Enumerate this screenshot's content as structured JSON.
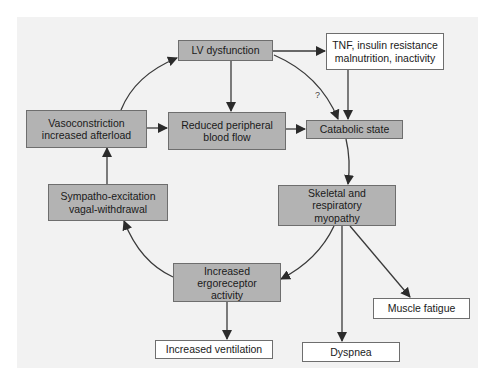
{
  "diagram": {
    "colors": {
      "panel_background": "#f2f2f2",
      "process_box_fill": "#b3b3b3",
      "outcome_box_fill": "#ffffff",
      "arrow": "#333333"
    },
    "nodes": {
      "lv_dysfunction": {
        "label": "LV dysfunction",
        "style": "gray"
      },
      "tnf": {
        "line1": "TNF, insulin resistance",
        "line2": "malnutrition, inactivity",
        "style": "white"
      },
      "vasoconstriction": {
        "line1": "Vasoconstriction",
        "line2": "increased afterload",
        "style": "gray"
      },
      "reduced_flow": {
        "line1": "Reduced peripheral",
        "line2": "blood flow",
        "style": "gray"
      },
      "catabolic": {
        "label": "Catabolic state",
        "style": "gray"
      },
      "sympatho": {
        "line1": "Sympatho-excitation",
        "line2": "vagal-withdrawal",
        "style": "gray"
      },
      "myopathy": {
        "line1": "Skeletal and respiratory",
        "line2": "myopathy",
        "style": "gray"
      },
      "ergoreceptor": {
        "line1": "Increased",
        "line2": "ergoreceptor",
        "line3": "activity",
        "style": "gray"
      },
      "muscle_fatigue": {
        "label": "Muscle fatigue",
        "style": "white"
      },
      "ventilation": {
        "label": "Increased ventilation",
        "style": "white"
      },
      "dyspnea": {
        "label": "Dyspnea",
        "style": "white"
      }
    },
    "edges": [
      {
        "from": "lv_dysfunction",
        "to": "tnf"
      },
      {
        "from": "lv_dysfunction",
        "to": "reduced_flow"
      },
      {
        "from": "lv_dysfunction",
        "to": "catabolic",
        "label": "?"
      },
      {
        "from": "tnf",
        "to": "catabolic"
      },
      {
        "from": "vasoconstriction",
        "to": "lv_dysfunction"
      },
      {
        "from": "vasoconstriction",
        "to": "reduced_flow"
      },
      {
        "from": "reduced_flow",
        "to": "catabolic"
      },
      {
        "from": "catabolic",
        "to": "myopathy"
      },
      {
        "from": "myopathy",
        "to": "ergoreceptor"
      },
      {
        "from": "myopathy",
        "to": "dyspnea"
      },
      {
        "from": "myopathy",
        "to": "muscle_fatigue"
      },
      {
        "from": "ergoreceptor",
        "to": "sympatho"
      },
      {
        "from": "ergoreceptor",
        "to": "ventilation"
      },
      {
        "from": "sympatho",
        "to": "vasoconstriction"
      }
    ],
    "question_mark": "?"
  }
}
